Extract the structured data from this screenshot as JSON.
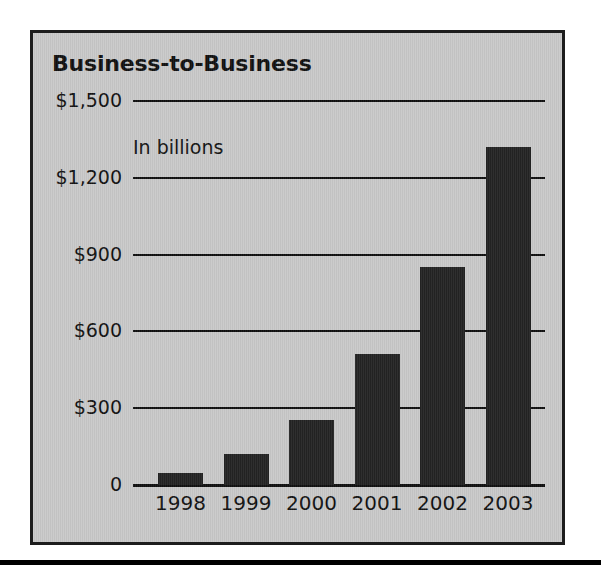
{
  "figure": {
    "title": "Business-to-Business",
    "subtitle": "In billions"
  },
  "chart_data": {
    "type": "bar",
    "title": "Business-to-Business",
    "subtitle": "In billions",
    "xlabel": "",
    "ylabel": "",
    "categories": [
      "1998",
      "1999",
      "2000",
      "2001",
      "2002",
      "2003"
    ],
    "values": [
      47,
      123,
      254,
      513,
      852,
      1322
    ],
    "ylim": [
      0,
      1500
    ],
    "yticks": [
      0,
      300,
      600,
      900,
      1200,
      1500
    ],
    "ytick_labels": [
      "0",
      "$300",
      "$600",
      "$900",
      "$1,200",
      "$1,500"
    ],
    "grid": true,
    "legend": false,
    "bar_color": "#232323",
    "panel_color": "#c9c9c9",
    "axis_color": "#101010",
    "series": [
      {
        "name": "Business-to-Business",
        "values": [
          47,
          123,
          254,
          513,
          852,
          1322
        ]
      }
    ]
  }
}
